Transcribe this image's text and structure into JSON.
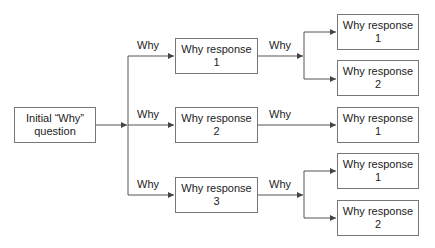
{
  "root": {
    "label": "Initial “Why”\nquestion"
  },
  "edge_label": "Why",
  "level1": [
    {
      "label": "Why response\n1"
    },
    {
      "label": "Why response\n2"
    },
    {
      "label": "Why response\n3"
    }
  ],
  "level2": [
    {
      "label": "Why response\n1"
    },
    {
      "label": "Why response\n2"
    },
    {
      "label": "Why response\n1"
    },
    {
      "label": "Why response\n1"
    },
    {
      "label": "Why response\n2"
    }
  ],
  "colors": {
    "line": "#555555",
    "border": "#777777",
    "text": "#222222"
  }
}
